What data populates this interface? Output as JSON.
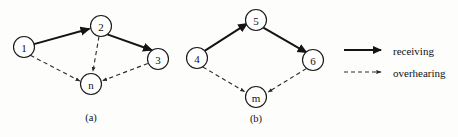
{
  "figure": {
    "type": "diagram",
    "background_color": "#fdfdfc",
    "line_color": "#141414",
    "node_fill": "#ffffff",
    "panels": [
      {
        "id": "panel-a",
        "caption": "(a)",
        "nodes": [
          {
            "id": "1",
            "label": "1",
            "cx": 24,
            "cy": 47,
            "r": 10.5
          },
          {
            "id": "2",
            "label": "2",
            "cx": 101,
            "cy": 26,
            "r": 10.5
          },
          {
            "id": "3",
            "label": "3",
            "cx": 158,
            "cy": 59,
            "r": 10.5
          },
          {
            "id": "n",
            "label": "n",
            "cx": 91,
            "cy": 84,
            "r": 10.5
          }
        ],
        "edges": [
          {
            "from": "1",
            "to": "2",
            "style": "solid",
            "kind": "receiving"
          },
          {
            "from": "2",
            "to": "3",
            "style": "solid",
            "kind": "receiving"
          },
          {
            "from": "1",
            "to": "n",
            "style": "dashed",
            "kind": "overhearing"
          },
          {
            "from": "2",
            "to": "n",
            "style": "dashed",
            "kind": "overhearing"
          },
          {
            "from": "3",
            "to": "n",
            "style": "dashed",
            "kind": "overhearing"
          }
        ]
      },
      {
        "id": "panel-b",
        "caption": "(b)",
        "nodes": [
          {
            "id": "4",
            "label": "4",
            "cx": 197,
            "cy": 58,
            "r": 10.5
          },
          {
            "id": "5",
            "label": "5",
            "cx": 256,
            "cy": 20,
            "r": 10.5
          },
          {
            "id": "6",
            "label": "6",
            "cx": 313,
            "cy": 60,
            "r": 10.5
          },
          {
            "id": "m",
            "label": "m",
            "cx": 256,
            "cy": 97,
            "r": 10.5
          }
        ],
        "edges": [
          {
            "from": "4",
            "to": "5",
            "style": "solid",
            "kind": "receiving"
          },
          {
            "from": "5",
            "to": "6",
            "style": "solid",
            "kind": "receiving"
          },
          {
            "from": "4",
            "to": "m",
            "style": "dashed",
            "kind": "overhearing"
          },
          {
            "from": "6",
            "to": "m",
            "style": "dashed",
            "kind": "overhearing"
          }
        ]
      }
    ],
    "captions": {
      "a": "(a)",
      "b": "(b)"
    },
    "legend": {
      "items": [
        {
          "id": "legend-receiving",
          "label": "receiving",
          "style": "solid"
        },
        {
          "id": "legend-overhearing",
          "label": "overhearing",
          "style": "dashed"
        }
      ]
    }
  }
}
